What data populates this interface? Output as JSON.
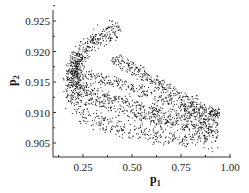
{
  "chart_data": {
    "type": "scatter",
    "title": "",
    "xlabel": "p1",
    "ylabel": "p2",
    "xlim": [
      0.1,
      1.0
    ],
    "ylim": [
      0.9025,
      0.9265
    ],
    "x_ticks": [
      0.25,
      0.5,
      0.75,
      1.0
    ],
    "x_tick_labels": [
      "0.25",
      "0.50",
      "0.75",
      "1.00"
    ],
    "y_ticks": [
      0.905,
      0.91,
      0.915,
      0.92,
      0.925
    ],
    "y_tick_labels": [
      "0.905",
      "0.910",
      "0.915",
      "0.920",
      "0.925"
    ],
    "grid": false,
    "legend": null,
    "marker_color": "#111111",
    "bands": [
      {
        "name": "upper-arm-outer",
        "points": [
          [
            0.43,
            0.9245
          ],
          [
            0.33,
            0.923
          ],
          [
            0.24,
            0.9205
          ],
          [
            0.195,
            0.918
          ],
          [
            0.2,
            0.915
          ],
          [
            0.26,
            0.9125
          ],
          [
            0.45,
            0.9105
          ],
          [
            0.7,
            0.9085
          ],
          [
            0.93,
            0.907
          ]
        ],
        "width": 0.0006,
        "n": 520
      },
      {
        "name": "upper-arm-inner",
        "points": [
          [
            0.42,
            0.9228
          ],
          [
            0.32,
            0.9215
          ],
          [
            0.25,
            0.9195
          ],
          [
            0.215,
            0.9175
          ],
          [
            0.22,
            0.9155
          ],
          [
            0.3,
            0.9135
          ],
          [
            0.5,
            0.9115
          ],
          [
            0.75,
            0.9095
          ],
          [
            0.94,
            0.9085
          ]
        ],
        "width": 0.0005,
        "n": 420
      },
      {
        "name": "middle-arm",
        "points": [
          [
            0.4,
            0.919
          ],
          [
            0.55,
            0.9165
          ],
          [
            0.7,
            0.9135
          ],
          [
            0.85,
            0.911
          ],
          [
            0.94,
            0.9095
          ]
        ],
        "width": 0.0006,
        "n": 340
      },
      {
        "name": "middle-arm-2",
        "points": [
          [
            0.2,
            0.9165
          ],
          [
            0.3,
            0.916
          ],
          [
            0.45,
            0.9148
          ],
          [
            0.62,
            0.9125
          ],
          [
            0.8,
            0.9105
          ],
          [
            0.94,
            0.91
          ]
        ],
        "width": 0.0005,
        "n": 320
      },
      {
        "name": "lower-sparse",
        "points": [
          [
            0.19,
            0.9125
          ],
          [
            0.24,
            0.91
          ],
          [
            0.35,
            0.9082
          ],
          [
            0.55,
            0.9068
          ],
          [
            0.75,
            0.9058
          ],
          [
            0.94,
            0.906
          ]
        ],
        "width": 0.0009,
        "n": 360
      },
      {
        "name": "left-turn",
        "points": [
          [
            0.22,
            0.92
          ],
          [
            0.195,
            0.9175
          ],
          [
            0.19,
            0.915
          ],
          [
            0.2,
            0.912
          ]
        ],
        "width": 0.0007,
        "n": 200
      }
    ]
  }
}
